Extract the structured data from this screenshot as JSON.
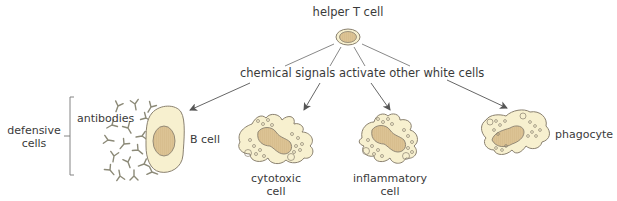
{
  "diagram": {
    "top_node": {
      "label": "helper T cell"
    },
    "signal_label": "chemical signals activate other white cells",
    "group": {
      "label_line1": "defensive",
      "label_line2": "cells"
    },
    "targets": [
      {
        "id": "b-cell",
        "label": "B cell",
        "extra_label": "antibodies"
      },
      {
        "id": "cytotoxic",
        "label_line1": "cytotoxic",
        "label_line2": "cell"
      },
      {
        "id": "inflammatory",
        "label_line1": "inflammatory",
        "label_line2": "cell"
      },
      {
        "id": "phagocyte",
        "label": "phagocyte"
      }
    ],
    "colors": {
      "cell_fill": "#f7f0cf",
      "nucleus_fill": "#dcc394",
      "outline": "#8a8170",
      "arrow": "#555555",
      "antibody": "#8c8a78"
    }
  }
}
